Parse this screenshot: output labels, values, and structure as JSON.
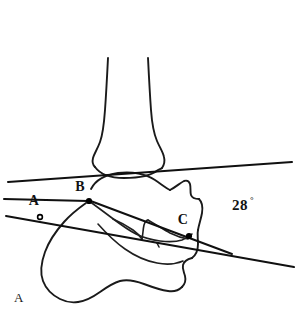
{
  "figure": {
    "panel_label": "A",
    "background_color": "#ffffff",
    "ink_color": "#1a1a1a",
    "description_type": "lateral-ankle-radiograph-tracing",
    "caption_bleed": ""
  },
  "annotations": {
    "points": [
      {
        "id": "A",
        "label": "A",
        "x": 34,
        "y": 205,
        "marker": "open-dot",
        "marker_x": 40,
        "marker_y": 217
      },
      {
        "id": "B",
        "label": "B",
        "x": 80,
        "y": 191,
        "marker": "filled-dot",
        "marker_x": 89,
        "marker_y": 201
      },
      {
        "id": "C",
        "label": "C",
        "x": 183,
        "y": 224,
        "marker": "filled-dot",
        "marker_x": 189,
        "marker_y": 236
      }
    ],
    "angle": {
      "value": "28",
      "degree_symbol": "°",
      "label_x": 232,
      "label_y": 210
    }
  },
  "structures": {
    "tibia_label": "tibia",
    "talus_label": "talus",
    "calcaneus_label": "calcaneus",
    "sinus_tarsi_label": "sinus-tarsi"
  },
  "lines": {
    "upper_line": {
      "name": "tibial-axis-reference-line",
      "x1": 8,
      "y1": 182,
      "x2": 292,
      "y2": 162
    },
    "lower_line": {
      "name": "calcaneal-inclination-line",
      "x1": 6,
      "y1": 216,
      "x2": 294,
      "y2": 267
    }
  }
}
